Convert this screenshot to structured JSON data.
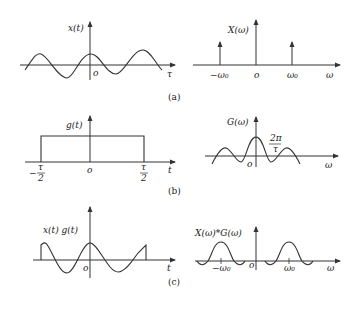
{
  "figure": {
    "panels": [
      {
        "caption": "(a)",
        "left": {
          "ylabel": "x(t)",
          "xlabel": "τ",
          "origin": "o"
        },
        "right": {
          "ylabel": "X(ω)",
          "xlabel": "ω",
          "origin": "o",
          "ticks": [
            "−ω₀",
            "ω₀"
          ]
        }
      },
      {
        "caption": "(b)",
        "left": {
          "ylabel": "g(t)",
          "xlabel": "t",
          "origin": "o",
          "ticks": [
            "−τ/2",
            "τ/2"
          ],
          "tick_num": "τ",
          "tick_den": "2",
          "neg": "−"
        },
        "right": {
          "ylabel": "G(ω)",
          "xlabel": "ω",
          "origin": "o",
          "annot_num": "2π",
          "annot_den": "τ"
        }
      },
      {
        "caption": "(c)",
        "left": {
          "ylabel": "x(t) g(t)",
          "xlabel": "t",
          "origin": "o"
        },
        "right": {
          "ylabel": "X(ω)*G(ω)",
          "xlabel": "ω",
          "origin": "o",
          "ticks": [
            "−ω₀",
            "ω₀"
          ]
        }
      }
    ]
  }
}
